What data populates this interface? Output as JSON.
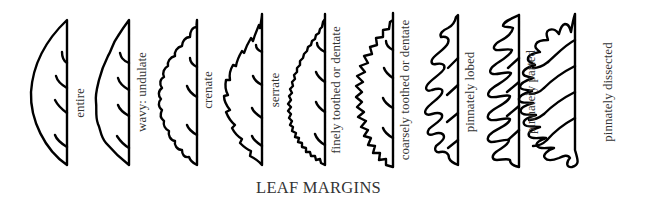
{
  "title": "LEAF MARGINS",
  "leaves": [
    {
      "id": "entire",
      "label": "entire"
    },
    {
      "id": "undulate",
      "label": "wavy: undulate"
    },
    {
      "id": "crenate",
      "label": "crenate"
    },
    {
      "id": "serrate",
      "label": "serrate"
    },
    {
      "id": "finely-toothed",
      "label": "finely toothed or dentate"
    },
    {
      "id": "coarsely-toothed",
      "label": "coarsely toothed or dentate"
    },
    {
      "id": "pinnately-lobed",
      "label": "pinnately lobed"
    },
    {
      "id": "pinnately-parted",
      "label": "pinnately parted"
    },
    {
      "id": "pinnately-dissected",
      "label": "pinnately dissected"
    }
  ]
}
